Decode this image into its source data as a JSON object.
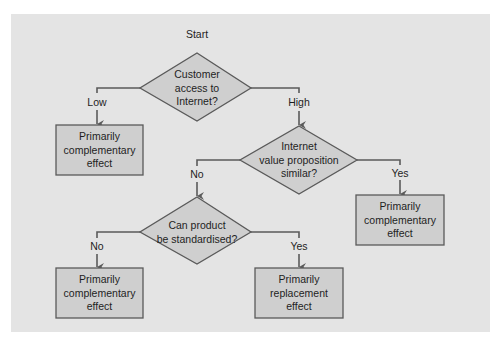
{
  "diagram": {
    "start_label": "Start",
    "colors": {
      "panel_bg": "#e4e4e4",
      "shape_fill": "#cfcfcf",
      "stroke": "#5a5a5a",
      "text": "#1e1e1e"
    },
    "decisions": [
      {
        "id": "d1",
        "lines": [
          "Customer",
          "access to",
          "Internet?"
        ]
      },
      {
        "id": "d2",
        "lines": [
          "Internet",
          "value proposition",
          "similar?"
        ]
      },
      {
        "id": "d3",
        "lines": [
          "Can product",
          "be standardised?"
        ]
      }
    ],
    "outcomes": [
      {
        "id": "o1",
        "lines": [
          "Primarily",
          "complementary",
          "effect"
        ]
      },
      {
        "id": "o2",
        "lines": [
          "Primarily",
          "complementary",
          "effect"
        ]
      },
      {
        "id": "o3",
        "lines": [
          "Primarily",
          "complementary",
          "effect"
        ]
      },
      {
        "id": "o4",
        "lines": [
          "Primarily",
          "replacement",
          "effect"
        ]
      }
    ],
    "edges": [
      {
        "from": "d1",
        "to": "o1",
        "label": "Low"
      },
      {
        "from": "d1",
        "to": "d2",
        "label": "High"
      },
      {
        "from": "d2",
        "to": "d3",
        "label": "No"
      },
      {
        "from": "d2",
        "to": "o2",
        "label": "Yes"
      },
      {
        "from": "d3",
        "to": "o3",
        "label": "No"
      },
      {
        "from": "d3",
        "to": "o4",
        "label": "Yes"
      }
    ]
  }
}
